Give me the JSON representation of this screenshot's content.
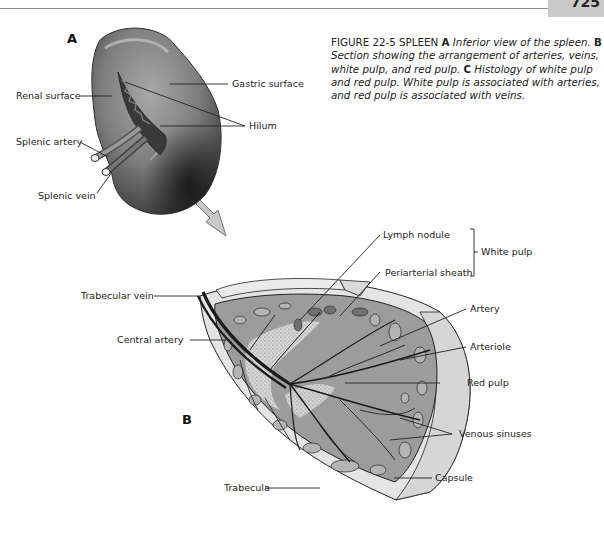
{
  "header": {
    "page_number": "725"
  },
  "figure": {
    "number": "FIGURE 22-5",
    "title": "SPLEEN",
    "caption_parts": [
      {
        "letter": "A",
        "text": "Inferior view of the spleen."
      },
      {
        "letter": "B",
        "text": "Section showing the arrangement of arteries, veins, white pulp, and red pulp."
      },
      {
        "letter": "C",
        "text": "Histology of white pulp and red pulp. White pulp is associated with arteries, and red pulp is associated with veins."
      }
    ]
  },
  "panel_a": {
    "letter": "A",
    "labels": {
      "renal_surface": "Renal surface",
      "gastric_surface": "Gastric surface",
      "hilum": "Hilum",
      "splenic_artery": "Splenic artery",
      "splenic_vein": "Splenic vein"
    }
  },
  "panel_b": {
    "letter": "B",
    "labels": {
      "lymph_nodule": "Lymph nodule",
      "periarterial_sheath": "Periarterial sheath",
      "white_pulp": "White pulp",
      "trabecular_vein": "Trabecular vein",
      "central_artery": "Central artery",
      "artery": "Artery",
      "arteriole": "Arteriole",
      "red_pulp": "Red pulp",
      "venous_sinuses": "Venous sinuses",
      "capsule": "Capsule",
      "trabecula": "Trabecula"
    }
  },
  "colors": {
    "spleen_dark": "#3a3a3a",
    "spleen_mid": "#7a7a7a",
    "spleen_light": "#b8b8b8",
    "section_fill": "#9a9a9a",
    "capsule_fill": "#e2e2e2",
    "page_tab": "#c9c9c9"
  }
}
